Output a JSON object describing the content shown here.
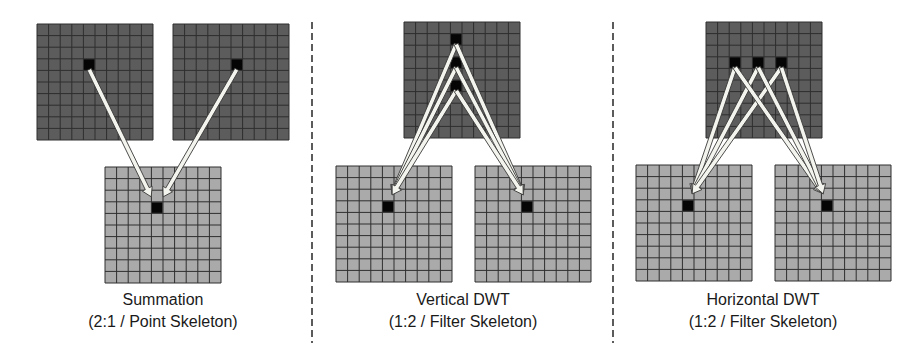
{
  "colors": {
    "dark_cell": "#5c5c5c",
    "light_cell": "#aaaaaa",
    "grid_line": "#2e2e2e",
    "highlight_cell": "#050505",
    "arrow_fill": "#f4f4ee",
    "arrow_stroke": "#3a3a3a",
    "divider": "#333333"
  },
  "grid": {
    "rows": 10,
    "cols": 10,
    "cell": 11.6
  },
  "dividers": [
    {
      "x": 312,
      "y1": 22,
      "y2": 343
    },
    {
      "x": 613,
      "y1": 22,
      "y2": 343
    }
  ],
  "panels": [
    {
      "id": "summation",
      "title": "Summation",
      "subtitle": "(2:1 / Point Skeleton)",
      "label_center_x": 163,
      "grids": [
        {
          "id": "input-a",
          "x": 37,
          "y": 24,
          "tone": "dark",
          "highlights": [
            [
              4,
              3
            ]
          ]
        },
        {
          "id": "input-b",
          "x": 173,
          "y": 24,
          "tone": "dark",
          "highlights": [
            [
              5,
              3
            ]
          ]
        },
        {
          "id": "output",
          "x": 105,
          "y": 167,
          "tone": "light",
          "highlights": [
            [
              4,
              3
            ]
          ]
        }
      ],
      "arrows": [
        {
          "from": [
            "input-a",
            4,
            3
          ],
          "to": [
            "output",
            4,
            3
          ],
          "end_offset": [
            -6,
            -5
          ]
        },
        {
          "from": [
            "input-b",
            5,
            3
          ],
          "to": [
            "output",
            4,
            3
          ],
          "end_offset": [
            6,
            -5
          ]
        }
      ]
    },
    {
      "id": "vertical-dwt",
      "title": "Vertical DWT",
      "subtitle": "(1:2 / Filter Skeleton)",
      "label_center_x": 463,
      "grids": [
        {
          "id": "input",
          "x": 404,
          "y": 22,
          "tone": "dark",
          "highlights": [
            [
              4,
              1
            ],
            [
              4,
              3
            ],
            [
              4,
              5
            ]
          ]
        },
        {
          "id": "output-low",
          "x": 336,
          "y": 166,
          "tone": "light",
          "highlights": [
            [
              4,
              3
            ]
          ]
        },
        {
          "id": "output-high",
          "x": 475,
          "y": 166,
          "tone": "light",
          "highlights": [
            [
              4,
              3
            ]
          ]
        }
      ],
      "arrows": [
        {
          "from": [
            "input",
            4,
            1
          ],
          "to": [
            "output-low",
            4,
            3
          ],
          "end_offset": [
            4,
            -6
          ]
        },
        {
          "from": [
            "input",
            4,
            3
          ],
          "to": [
            "output-low",
            4,
            3
          ],
          "end_offset": [
            4,
            -6
          ]
        },
        {
          "from": [
            "input",
            4,
            5
          ],
          "to": [
            "output-low",
            4,
            3
          ],
          "end_offset": [
            4,
            -6
          ]
        },
        {
          "from": [
            "input",
            4,
            1
          ],
          "to": [
            "output-high",
            4,
            3
          ],
          "end_offset": [
            -4,
            -6
          ]
        },
        {
          "from": [
            "input",
            4,
            3
          ],
          "to": [
            "output-high",
            4,
            3
          ],
          "end_offset": [
            -4,
            -6
          ]
        },
        {
          "from": [
            "input",
            4,
            5
          ],
          "to": [
            "output-high",
            4,
            3
          ],
          "end_offset": [
            -4,
            -6
          ]
        }
      ]
    },
    {
      "id": "horizontal-dwt",
      "title": "Horizontal DWT",
      "subtitle": "(1:2 / Filter Skeleton)",
      "label_center_x": 763,
      "grids": [
        {
          "id": "input",
          "x": 706,
          "y": 22,
          "tone": "dark",
          "highlights": [
            [
              2,
              3
            ],
            [
              4,
              3
            ],
            [
              6,
              3
            ]
          ]
        },
        {
          "id": "output-low",
          "x": 636,
          "y": 165,
          "tone": "light",
          "highlights": [
            [
              4,
              3
            ]
          ]
        },
        {
          "id": "output-high",
          "x": 775,
          "y": 165,
          "tone": "light",
          "highlights": [
            [
              4,
              3
            ]
          ]
        }
      ],
      "arrows": [
        {
          "from": [
            "input",
            2,
            3
          ],
          "to": [
            "output-low",
            4,
            3
          ],
          "end_offset": [
            4,
            -6
          ]
        },
        {
          "from": [
            "input",
            4,
            3
          ],
          "to": [
            "output-low",
            4,
            3
          ],
          "end_offset": [
            4,
            -6
          ]
        },
        {
          "from": [
            "input",
            6,
            3
          ],
          "to": [
            "output-low",
            4,
            3
          ],
          "end_offset": [
            4,
            -6
          ]
        },
        {
          "from": [
            "input",
            2,
            3
          ],
          "to": [
            "output-high",
            4,
            3
          ],
          "end_offset": [
            -4,
            -6
          ]
        },
        {
          "from": [
            "input",
            4,
            3
          ],
          "to": [
            "output-high",
            4,
            3
          ],
          "end_offset": [
            -4,
            -6
          ]
        },
        {
          "from": [
            "input",
            6,
            3
          ],
          "to": [
            "output-high",
            4,
            3
          ],
          "end_offset": [
            -4,
            -6
          ]
        }
      ]
    }
  ]
}
